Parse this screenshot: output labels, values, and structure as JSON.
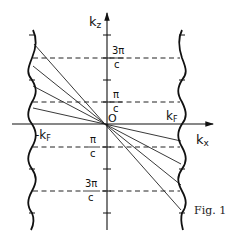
{
  "figure": {
    "caption": "Fig. 1",
    "axes": {
      "vertical_label_main": "k",
      "vertical_label_sub": "z",
      "horizontal_label_main": "k",
      "horizontal_label_sub": "x",
      "origin_label": "O"
    },
    "fermi_labels": {
      "right_main": "k",
      "right_sub": "F",
      "left_main": "-k",
      "left_sub": "F"
    },
    "levels": [
      {
        "num": "3π",
        "den": "c",
        "side": "right",
        "y": 58
      },
      {
        "num": "π",
        "den": "c",
        "side": "right",
        "y": 102
      },
      {
        "num": "π",
        "den": "c",
        "side": "left",
        "y": 147
      },
      {
        "num": "3π",
        "den": "c",
        "side": "left",
        "y": 191
      }
    ],
    "colors": {
      "ink": "#111111",
      "background": "#ffffff"
    }
  }
}
